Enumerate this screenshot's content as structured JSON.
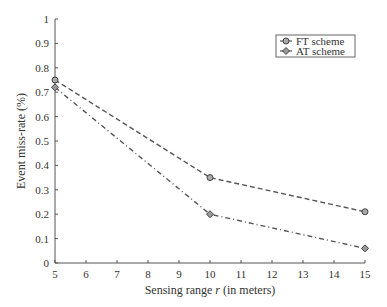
{
  "chart_data": {
    "type": "line",
    "title": "",
    "xlabel_prefix": "Sensing range ",
    "xlabel_var": "r",
    "xlabel_suffix": " (in meters)",
    "xlabel": "Sensing range r (in meters)",
    "ylabel": "Event miss-rate (%)",
    "xlim": [
      5,
      15
    ],
    "ylim": [
      0,
      1
    ],
    "xticks": [
      5,
      6,
      7,
      8,
      9,
      10,
      11,
      12,
      13,
      14,
      15
    ],
    "yticks": [
      0,
      0.1,
      0.2,
      0.3,
      0.4,
      0.5,
      0.6,
      0.7,
      0.8,
      0.9,
      1
    ],
    "ytick_labels": [
      "0",
      "0.1",
      "0.2",
      "0.3",
      "0.4",
      "0.5",
      "0.6",
      "0.7",
      "0.8",
      "0.9",
      "1"
    ],
    "grid": false,
    "legend_position": "upper right",
    "x": [
      5,
      10,
      15
    ],
    "series": [
      {
        "name": "FT scheme",
        "marker": "circle",
        "linestyle": "dashed",
        "values": [
          0.75,
          0.35,
          0.21
        ]
      },
      {
        "name": "AT scheme",
        "marker": "diamond",
        "linestyle": "dash-dot",
        "values": [
          0.72,
          0.2,
          0.06
        ]
      }
    ]
  },
  "legend": {
    "items": [
      "FT scheme",
      "AT scheme"
    ]
  }
}
